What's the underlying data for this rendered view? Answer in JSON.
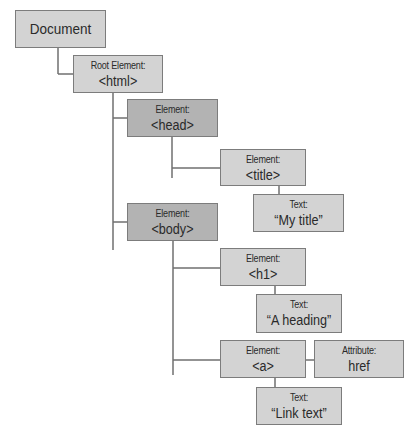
{
  "diagram": {
    "colors": {
      "node": "#d3d3d3",
      "node_highlight": "#b3b3b3",
      "border": "#7c7c7c",
      "line": "#6f6f6f"
    },
    "nodes": [
      {
        "id": "document",
        "label": "",
        "value": "Document"
      },
      {
        "id": "html",
        "label": "Root Element:",
        "value": "<html>"
      },
      {
        "id": "head",
        "label": "Element:",
        "value": "<head>"
      },
      {
        "id": "title",
        "label": "Element:",
        "value": "<title>"
      },
      {
        "id": "title-text",
        "label": "Text:",
        "value": "“My title”"
      },
      {
        "id": "body",
        "label": "Element:",
        "value": "<body>"
      },
      {
        "id": "h1",
        "label": "Element:",
        "value": "<h1>"
      },
      {
        "id": "h1-text",
        "label": "Text:",
        "value": "“A heading”"
      },
      {
        "id": "a",
        "label": "Element:",
        "value": "<a>"
      },
      {
        "id": "a-attr",
        "label": "Attribute:",
        "value": "href"
      },
      {
        "id": "a-text",
        "label": "Text:",
        "value": "“Link text”"
      }
    ],
    "edges": [
      [
        "document",
        "html"
      ],
      [
        "html",
        "head"
      ],
      [
        "html",
        "body"
      ],
      [
        "head",
        "title"
      ],
      [
        "title",
        "title-text"
      ],
      [
        "body",
        "h1"
      ],
      [
        "h1",
        "h1-text"
      ],
      [
        "body",
        "a"
      ],
      [
        "a",
        "a-attr"
      ],
      [
        "a",
        "a-text"
      ]
    ]
  }
}
